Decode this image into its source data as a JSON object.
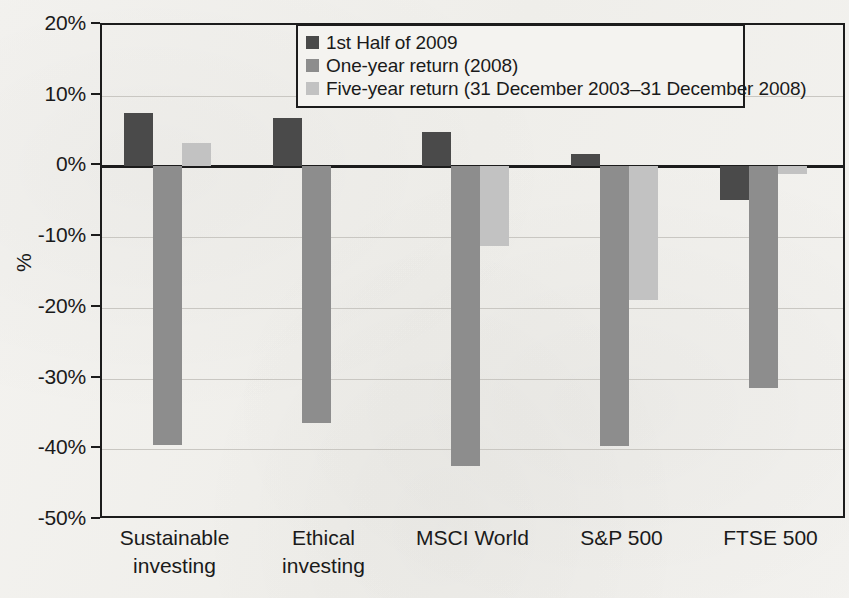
{
  "chart_data": {
    "type": "bar",
    "title": "",
    "xlabel": "",
    "ylabel": "%",
    "ylim": [
      -50,
      20
    ],
    "ytick_labels": [
      "20%",
      "10%",
      "0%",
      "-10%",
      "-20%",
      "-30%",
      "-40%",
      "-50%"
    ],
    "ytick_values": [
      20,
      10,
      0,
      -10,
      -20,
      -30,
      -40,
      -50
    ],
    "grid": true,
    "legend_position": "top-right-inside",
    "categories": [
      "Sustainable investing",
      "Ethical investing",
      "MSCI World",
      "S&P 500",
      "FTSE 500"
    ],
    "category_lines": [
      [
        "Sustainable",
        "investing"
      ],
      [
        "Ethical",
        "investing"
      ],
      [
        "MSCI World"
      ],
      [
        "S&P 500"
      ],
      [
        "FTSE 500"
      ]
    ],
    "series": [
      {
        "name": "1st Half of 2009",
        "color": "#4a4a4a",
        "values": [
          7.6,
          6.8,
          4.8,
          1.7,
          -4.8
        ]
      },
      {
        "name": "One-year return (2008)",
        "color": "#8d8d8d",
        "values": [
          -39.4,
          -36.3,
          -42.3,
          -39.5,
          -31.3
        ]
      },
      {
        "name": "Five-year return (31 December 2003–31 December 2008)",
        "color": "#c2c2c2",
        "values": [
          3.3,
          null,
          -11.3,
          -18.9,
          -1.1
        ]
      }
    ]
  },
  "legend": {
    "entries": [
      "1st Half of 2009",
      "One-year return (2008)",
      "Five-year return (31 December 2003–31 December 2008)"
    ]
  },
  "axis": {
    "y_title": "%"
  }
}
